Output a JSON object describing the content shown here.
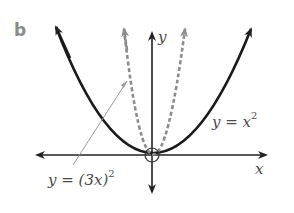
{
  "part_label": "b",
  "axes": {
    "x_label": "x",
    "y_label": "y",
    "origin_marker": "circle"
  },
  "curves": [
    {
      "name": "y = x^2",
      "label_prefix": "y = x",
      "label_exponent": "2",
      "style": "solid",
      "color": "#1a1a1a"
    },
    {
      "name": "y = (3x)^2",
      "label_prefix": "y = (3x)",
      "label_exponent": "2",
      "style": "dashed",
      "color": "#8c8c8c"
    }
  ],
  "colors": {
    "axis": "#222222",
    "solid_curve": "#1a1a1a",
    "dashed_curve": "#8c8c8c",
    "leader_line": "#9a9a9a",
    "label_text": "#4a4a4a",
    "part_label": "#8a8a8a"
  }
}
